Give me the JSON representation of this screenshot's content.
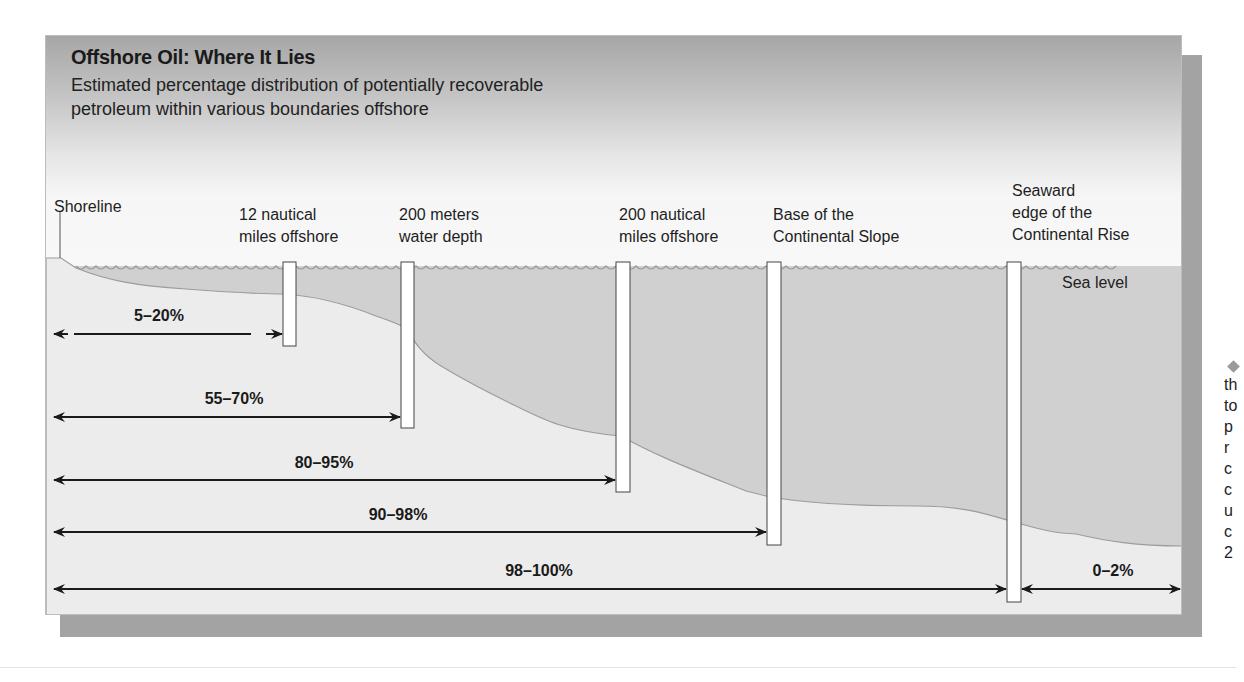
{
  "figure": {
    "title": "Offshore Oil: Where It Lies",
    "subtitle_line1": "Estimated percentage distribution of potentially recoverable",
    "subtitle_line2": "petroleum within various boundaries offshore"
  },
  "boundaries": [
    {
      "id": "shoreline",
      "line1": "Shoreline",
      "line2": ""
    },
    {
      "id": "12nm",
      "line1": "12 nautical",
      "line2": "miles offshore"
    },
    {
      "id": "200m",
      "line1": "200 meters",
      "line2": "water depth"
    },
    {
      "id": "200nm",
      "line1": "200 nautical",
      "line2": "miles offshore"
    },
    {
      "id": "slope",
      "line1": "Base of the",
      "line2": "Continental Slope"
    },
    {
      "id": "rise",
      "line1": "Seaward",
      "line2": "edge of the",
      "line3": "Continental Rise"
    }
  ],
  "sea_level_label": "Sea level",
  "ranges": [
    {
      "label": "5–20%",
      "to": "12 nautical miles offshore"
    },
    {
      "label": "55–70%",
      "to": "200 meters water depth"
    },
    {
      "label": "80–95%",
      "to": "200 nautical miles offshore"
    },
    {
      "label": "90–98%",
      "to": "Base of the Continental Slope"
    },
    {
      "label": "98–100%",
      "to": "Seaward edge of the Continental Rise"
    },
    {
      "label": "0–2%",
      "to": "Beyond the Continental Rise"
    }
  ],
  "side_text": {
    "lines": [
      "th",
      "to",
      "p",
      "r",
      "c",
      "c",
      "u",
      "c",
      "2"
    ]
  },
  "colors": {
    "water": "#d0d0d0",
    "land": "#ececec",
    "shadow": "#a3a3a3",
    "sky_top": "#a6a6a6",
    "sky_bottom": "#f8f8f8"
  }
}
